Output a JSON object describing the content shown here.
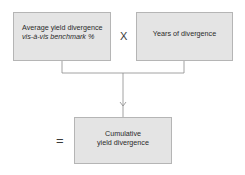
{
  "diagram": {
    "inputs": [
      {
        "id": "average-yield",
        "line1": "Average yield divergence",
        "line2": "vis-à-vis benchmark %"
      },
      {
        "id": "years",
        "label": "Years of divergence"
      }
    ],
    "operators": {
      "multiply": "X",
      "equals": "="
    },
    "output": {
      "line1": "Cumulative",
      "line2": "yield divergence"
    },
    "colors": {
      "box_fill": "#e4e4e4",
      "box_border": "#b5b5b5",
      "connector": "#8a8a8a",
      "text": "#2a2a2a"
    }
  }
}
